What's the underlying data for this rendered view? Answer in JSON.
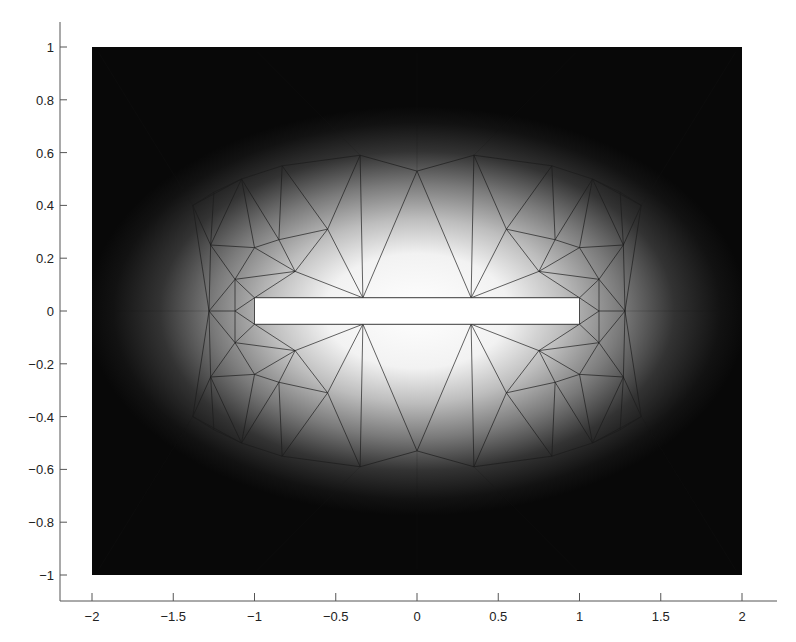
{
  "chart_data": {
    "type": "heatmap",
    "title": "",
    "xlabel": "",
    "ylabel": "",
    "xlim": [
      -2,
      2
    ],
    "ylim": [
      -1,
      1
    ],
    "grid": false,
    "colormap": "gray (bright near slot, dark at domain boundary)",
    "xticks": [
      -2,
      -1.5,
      -1,
      -0.5,
      0,
      0.5,
      1,
      1.5,
      2
    ],
    "xtick_labels": [
      "−2",
      "−1.5",
      "−1",
      "−0.5",
      "0",
      "0.5",
      "1",
      "1.5",
      "2"
    ],
    "yticks": [
      1,
      0.8,
      0.6,
      0.4,
      0.2,
      0,
      -0.2,
      -0.4,
      -0.6,
      -0.8,
      -1
    ],
    "ytick_labels": [
      "1",
      "0.8",
      "0.6",
      "0.4",
      "0.2",
      "0",
      "−0.2",
      "−0.4",
      "−0.6",
      "−0.8",
      "−1"
    ],
    "domain_rect": {
      "x": [
        -2,
        2
      ],
      "y": [
        -1,
        1
      ]
    },
    "slot_rect": {
      "x": [
        -1,
        1
      ],
      "y": [
        -0.05,
        0.05
      ],
      "fill": "#ffffff"
    },
    "mesh": {
      "description": "Triangular finite-element mesh surrounding a thin rectangular slot; field intensity decays from slot outward",
      "nodes": [
        [
          -1,
          0.05
        ],
        [
          -0.333,
          0.05
        ],
        [
          0.333,
          0.05
        ],
        [
          1,
          0.05
        ],
        [
          -1,
          -0.05
        ],
        [
          -0.333,
          -0.05
        ],
        [
          0.333,
          -0.05
        ],
        [
          1,
          -0.05
        ],
        [
          -1.12,
          0
        ],
        [
          -1.28,
          0
        ],
        [
          1.12,
          0
        ],
        [
          1.28,
          0
        ],
        [
          -0.75,
          0.15
        ],
        [
          0.75,
          0.15
        ],
        [
          -0.75,
          -0.15
        ],
        [
          0.75,
          -0.15
        ],
        [
          -1.12,
          0.12
        ],
        [
          1.12,
          0.12
        ],
        [
          -1.12,
          -0.12
        ],
        [
          1.12,
          -0.12
        ],
        [
          -1.0,
          0.24
        ],
        [
          -0.85,
          0.27
        ],
        [
          -0.55,
          0.31
        ],
        [
          0.55,
          0.31
        ],
        [
          0.85,
          0.27
        ],
        [
          1.0,
          0.24
        ],
        [
          -1.0,
          -0.24
        ],
        [
          -0.85,
          -0.27
        ],
        [
          -0.55,
          -0.31
        ],
        [
          0.55,
          -0.31
        ],
        [
          0.85,
          -0.27
        ],
        [
          1.0,
          -0.24
        ],
        [
          -1.27,
          0.25
        ],
        [
          1.27,
          0.25
        ],
        [
          -1.27,
          -0.25
        ],
        [
          1.27,
          -0.25
        ],
        [
          -1.38,
          0.4
        ],
        [
          -1.08,
          0.5
        ],
        [
          -0.83,
          0.55
        ],
        [
          -0.35,
          0.59
        ],
        [
          0,
          0.53
        ],
        [
          0.35,
          0.59
        ],
        [
          0.83,
          0.55
        ],
        [
          1.08,
          0.5
        ],
        [
          1.38,
          0.4
        ],
        [
          -1.38,
          -0.4
        ],
        [
          -1.08,
          -0.5
        ],
        [
          -0.83,
          -0.55
        ],
        [
          -0.35,
          -0.59
        ],
        [
          0,
          -0.53
        ],
        [
          0.35,
          -0.59
        ],
        [
          0.83,
          -0.55
        ],
        [
          1.08,
          -0.5
        ],
        [
          1.38,
          -0.4
        ],
        [
          -1.25,
          0.45
        ],
        [
          1.25,
          0.45
        ],
        [
          -1.25,
          -0.45
        ],
        [
          1.25,
          -0.45
        ]
      ],
      "edges": [
        [
          0,
          1
        ],
        [
          1,
          2
        ],
        [
          2,
          3
        ],
        [
          4,
          5
        ],
        [
          5,
          6
        ],
        [
          6,
          7
        ],
        [
          0,
          4
        ],
        [
          3,
          7
        ],
        [
          0,
          8
        ],
        [
          4,
          8
        ],
        [
          8,
          9
        ],
        [
          3,
          10
        ],
        [
          7,
          10
        ],
        [
          10,
          11
        ],
        [
          0,
          16
        ],
        [
          8,
          16
        ],
        [
          9,
          16
        ],
        [
          4,
          18
        ],
        [
          8,
          18
        ],
        [
          9,
          18
        ],
        [
          3,
          17
        ],
        [
          10,
          17
        ],
        [
          11,
          17
        ],
        [
          7,
          19
        ],
        [
          10,
          19
        ],
        [
          11,
          19
        ],
        [
          0,
          12
        ],
        [
          1,
          12
        ],
        [
          16,
          12
        ],
        [
          12,
          20
        ],
        [
          16,
          20
        ],
        [
          12,
          21
        ],
        [
          20,
          21
        ],
        [
          12,
          22
        ],
        [
          1,
          22
        ],
        [
          21,
          22
        ],
        [
          3,
          13
        ],
        [
          2,
          13
        ],
        [
          17,
          13
        ],
        [
          13,
          25
        ],
        [
          17,
          25
        ],
        [
          13,
          24
        ],
        [
          25,
          24
        ],
        [
          13,
          23
        ],
        [
          2,
          23
        ],
        [
          24,
          23
        ],
        [
          4,
          14
        ],
        [
          5,
          14
        ],
        [
          18,
          14
        ],
        [
          14,
          26
        ],
        [
          18,
          26
        ],
        [
          14,
          27
        ],
        [
          26,
          27
        ],
        [
          14,
          28
        ],
        [
          5,
          28
        ],
        [
          27,
          28
        ],
        [
          7,
          15
        ],
        [
          6,
          15
        ],
        [
          19,
          15
        ],
        [
          15,
          31
        ],
        [
          19,
          31
        ],
        [
          15,
          30
        ],
        [
          31,
          30
        ],
        [
          15,
          29
        ],
        [
          6,
          29
        ],
        [
          30,
          29
        ],
        [
          9,
          32
        ],
        [
          16,
          32
        ],
        [
          20,
          32
        ],
        [
          9,
          34
        ],
        [
          18,
          34
        ],
        [
          26,
          34
        ],
        [
          11,
          33
        ],
        [
          17,
          33
        ],
        [
          25,
          33
        ],
        [
          11,
          35
        ],
        [
          19,
          35
        ],
        [
          31,
          35
        ],
        [
          1,
          39
        ],
        [
          1,
          40
        ],
        [
          2,
          40
        ],
        [
          2,
          41
        ],
        [
          22,
          39
        ],
        [
          23,
          41
        ],
        [
          22,
          38
        ],
        [
          21,
          38
        ],
        [
          20,
          37
        ],
        [
          21,
          37
        ],
        [
          32,
          36
        ],
        [
          32,
          37
        ],
        [
          36,
          37
        ],
        [
          37,
          38
        ],
        [
          38,
          39
        ],
        [
          39,
          40
        ],
        [
          40,
          41
        ],
        [
          41,
          42
        ],
        [
          42,
          43
        ],
        [
          43,
          44
        ],
        [
          23,
          42
        ],
        [
          24,
          42
        ],
        [
          24,
          43
        ],
        [
          25,
          43
        ],
        [
          33,
          43
        ],
        [
          33,
          44
        ],
        [
          5,
          48
        ],
        [
          5,
          49
        ],
        [
          6,
          49
        ],
        [
          6,
          50
        ],
        [
          28,
          48
        ],
        [
          29,
          50
        ],
        [
          28,
          47
        ],
        [
          27,
          47
        ],
        [
          26,
          46
        ],
        [
          27,
          46
        ],
        [
          34,
          45
        ],
        [
          34,
          46
        ],
        [
          45,
          46
        ],
        [
          46,
          47
        ],
        [
          47,
          48
        ],
        [
          48,
          49
        ],
        [
          49,
          50
        ],
        [
          50,
          51
        ],
        [
          51,
          52
        ],
        [
          52,
          53
        ],
        [
          29,
          51
        ],
        [
          30,
          51
        ],
        [
          30,
          52
        ],
        [
          31,
          52
        ],
        [
          35,
          52
        ],
        [
          35,
          53
        ],
        [
          32,
          54
        ],
        [
          36,
          54
        ],
        [
          37,
          54
        ],
        [
          33,
          55
        ],
        [
          44,
          55
        ],
        [
          43,
          55
        ],
        [
          34,
          56
        ],
        [
          45,
          56
        ],
        [
          46,
          56
        ],
        [
          35,
          57
        ],
        [
          53,
          57
        ],
        [
          52,
          57
        ],
        [
          9,
          36
        ],
        [
          9,
          45
        ],
        [
          11,
          44
        ],
        [
          11,
          53
        ]
      ]
    }
  }
}
